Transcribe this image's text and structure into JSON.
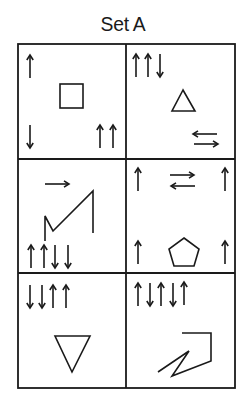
{
  "title": "Set A",
  "colors": {
    "ink": "#1a1a1a",
    "background": "#ffffff"
  },
  "table": {
    "rows": 3,
    "cols": 2,
    "cells": [
      {
        "id": "r1c1",
        "shape": "square",
        "arrows": [
          {
            "position": "top-left",
            "sequence": [
              "up"
            ]
          },
          {
            "position": "bottom-left",
            "sequence": [
              "down"
            ]
          },
          {
            "position": "bottom-right",
            "sequence": [
              "up",
              "up"
            ]
          }
        ]
      },
      {
        "id": "r1c2",
        "shape": "triangle-up",
        "arrows": [
          {
            "position": "top-left",
            "sequence": [
              "up",
              "up",
              "down"
            ]
          },
          {
            "position": "bottom-right",
            "sequence": [
              "left-over-right"
            ]
          }
        ]
      },
      {
        "id": "r2c1",
        "shape": "zigzag-line",
        "arrows": [
          {
            "position": "top-center",
            "sequence": [
              "right"
            ]
          },
          {
            "position": "bottom-left",
            "sequence": [
              "up",
              "up",
              "down",
              "down"
            ]
          }
        ]
      },
      {
        "id": "r2c2",
        "shape": "pentagon",
        "arrows": [
          {
            "position": "top-left",
            "sequence": [
              "up"
            ]
          },
          {
            "position": "top-center",
            "sequence": [
              "right-over-left"
            ]
          },
          {
            "position": "top-right",
            "sequence": [
              "up"
            ]
          },
          {
            "position": "bottom-left",
            "sequence": [
              "up"
            ]
          },
          {
            "position": "bottom-right",
            "sequence": [
              "up"
            ]
          }
        ]
      },
      {
        "id": "r3c1",
        "shape": "triangle-down",
        "arrows": [
          {
            "position": "top-left",
            "sequence": [
              "down",
              "down",
              "up",
              "up"
            ]
          }
        ]
      },
      {
        "id": "r3c2",
        "shape": "angular-zigzag",
        "arrows": [
          {
            "position": "top-left",
            "sequence": [
              "up",
              "down",
              "up",
              "down",
              "up"
            ]
          }
        ]
      }
    ]
  }
}
